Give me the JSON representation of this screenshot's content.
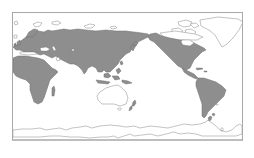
{
  "map": {
    "projection": "equirectangular, Pacific-centered",
    "colors": {
      "background": "#ffffff",
      "frame": "#a8a8a8",
      "shaded_land": "#8e8e8e",
      "shaded_outline": "#6e6e6e",
      "unshaded_outline": "#9a9a9a"
    },
    "legend": null,
    "regions_shaded": [
      "Europe",
      "Asia",
      "Africa",
      "North America",
      "Central America",
      "South America",
      "Southeast Asia",
      "New Zealand (North Island)",
      "Madagascar"
    ],
    "regions_unshaded": [
      "Greenland",
      "Canadian Arctic Archipelago",
      "Arctic islands",
      "Australia",
      "Antarctica"
    ]
  }
}
